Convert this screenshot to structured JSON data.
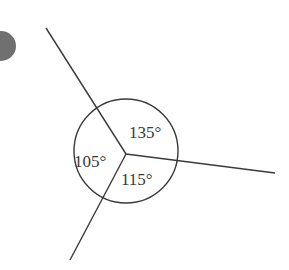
{
  "diagram": {
    "type": "angles-at-a-point",
    "colors": {
      "stroke": "#3a3a3a",
      "marker_fill": "#707070",
      "background": "#ffffff"
    },
    "angles": [
      {
        "value": 135,
        "label": "135°",
        "region": "upper-right"
      },
      {
        "value": 105,
        "label": "105°",
        "region": "left"
      },
      {
        "value": 115,
        "label": "115°",
        "region": "lower-right"
      }
    ],
    "angle_sum": 355
  }
}
